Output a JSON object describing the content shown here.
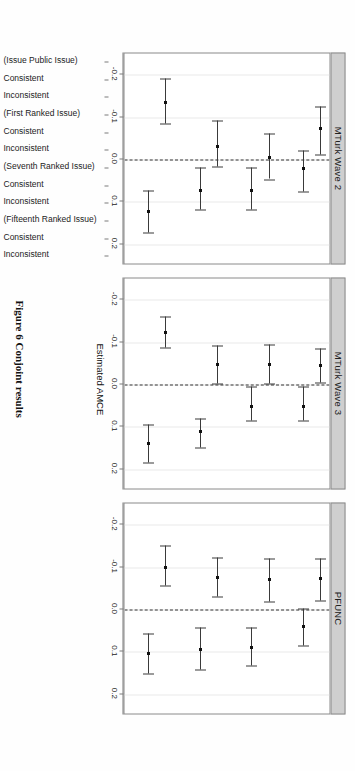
{
  "figure": {
    "caption": "Figure 6 Conjoint results",
    "xtitle": "Estimated AMCE"
  },
  "chart_data": {
    "type": "scatter",
    "title": "Figure 6 Conjoint results",
    "xlabel": "Estimated AMCE",
    "ylabel": "",
    "xlim": [
      -0.25,
      0.25
    ],
    "xticks": [
      -0.2,
      -0.1,
      0.0,
      0.1,
      0.2
    ],
    "xticklabels": [
      "-0.2",
      "-0.1",
      "0.0",
      "0.1",
      "0.2"
    ],
    "grid": true,
    "legend": "none",
    "reference_line": 0.0,
    "orientation": "horizontal-forest-plot",
    "categories": [
      "(Issue Public Issue)",
      "Consistent",
      "Inconsistent",
      "(First Ranked Issue)",
      "Consistent",
      "Inconsistent",
      "(Seventh Ranked Issue)",
      "Consistent",
      "Inconsistent",
      "(Fifteenth Ranked Issue)",
      "Consistent",
      "Inconsistent"
    ],
    "panels": [
      {
        "name": "MTurk Wave 2",
        "points": [
          {
            "category": "(Issue Public Issue)",
            "estimate": null,
            "lower": null,
            "upper": null
          },
          {
            "category": "Consistent",
            "estimate": 0.122,
            "lower": 0.073,
            "upper": 0.173
          },
          {
            "category": "Inconsistent",
            "estimate": -0.135,
            "lower": -0.19,
            "upper": -0.086
          },
          {
            "category": "(First Ranked Issue)",
            "estimate": null,
            "lower": null,
            "upper": null
          },
          {
            "category": "Consistent",
            "estimate": 0.072,
            "lower": 0.02,
            "upper": 0.118
          },
          {
            "category": "Inconsistent",
            "estimate": -0.03,
            "lower": -0.092,
            "upper": 0.017
          },
          {
            "category": "(Seventh Ranked Issue)",
            "estimate": null,
            "lower": null,
            "upper": null
          },
          {
            "category": "Consistent",
            "estimate": 0.072,
            "lower": 0.018,
            "upper": 0.118
          },
          {
            "category": "Inconsistent",
            "estimate": -0.005,
            "lower": -0.062,
            "upper": 0.046
          },
          {
            "category": "(Fifteenth Ranked Issue)",
            "estimate": null,
            "lower": null,
            "upper": null
          },
          {
            "category": "Consistent",
            "estimate": 0.022,
            "lower": -0.022,
            "upper": 0.075
          },
          {
            "category": "Inconsistent",
            "estimate": -0.072,
            "lower": -0.124,
            "upper": -0.012
          }
        ]
      },
      {
        "name": "MTurk Wave 3",
        "points": [
          {
            "category": "(Issue Public Issue)",
            "estimate": null,
            "lower": null,
            "upper": null
          },
          {
            "category": "Consistent",
            "estimate": 0.14,
            "lower": 0.094,
            "upper": 0.185
          },
          {
            "category": "Inconsistent",
            "estimate": -0.122,
            "lower": -0.16,
            "upper": -0.088
          },
          {
            "category": "(First Ranked Issue)",
            "estimate": null,
            "lower": null,
            "upper": null
          },
          {
            "category": "Consistent",
            "estimate": 0.112,
            "lower": 0.08,
            "upper": 0.148
          },
          {
            "category": "Inconsistent",
            "estimate": -0.048,
            "lower": -0.092,
            "upper": -0.002
          },
          {
            "category": "(Seventh Ranked Issue)",
            "estimate": null,
            "lower": null,
            "upper": null
          },
          {
            "category": "Consistent",
            "estimate": 0.052,
            "lower": 0.004,
            "upper": 0.086
          },
          {
            "category": "Inconsistent",
            "estimate": -0.048,
            "lower": -0.094,
            "upper": -0.002
          },
          {
            "category": "(Fifteenth Ranked Issue)",
            "estimate": null,
            "lower": null,
            "upper": null
          },
          {
            "category": "Consistent",
            "estimate": 0.052,
            "lower": 0.004,
            "upper": 0.086
          },
          {
            "category": "Inconsistent",
            "estimate": -0.044,
            "lower": -0.084,
            "upper": -0.004
          }
        ]
      },
      {
        "name": "PFUNC",
        "points": [
          {
            "category": "(Issue Public Issue)",
            "estimate": null,
            "lower": null,
            "upper": null
          },
          {
            "category": "Consistent",
            "estimate": 0.104,
            "lower": 0.056,
            "upper": 0.15
          },
          {
            "category": "Inconsistent",
            "estimate": -0.098,
            "lower": -0.15,
            "upper": -0.056
          },
          {
            "category": "(First Ranked Issue)",
            "estimate": null,
            "lower": null,
            "upper": null
          },
          {
            "category": "Consistent",
            "estimate": 0.094,
            "lower": 0.042,
            "upper": 0.142
          },
          {
            "category": "Inconsistent",
            "estimate": -0.076,
            "lower": -0.122,
            "upper": -0.03
          },
          {
            "category": "(Seventh Ranked Issue)",
            "estimate": null,
            "lower": null,
            "upper": null
          },
          {
            "category": "Consistent",
            "estimate": 0.09,
            "lower": 0.042,
            "upper": 0.132
          },
          {
            "category": "Inconsistent",
            "estimate": -0.07,
            "lower": -0.12,
            "upper": -0.018
          },
          {
            "category": "(Fifteenth Ranked Issue)",
            "estimate": null,
            "lower": null,
            "upper": null
          },
          {
            "category": "Consistent",
            "estimate": 0.04,
            "lower": -0.002,
            "upper": 0.084
          },
          {
            "category": "Inconsistent",
            "estimate": -0.072,
            "lower": -0.12,
            "upper": -0.022
          }
        ]
      }
    ]
  },
  "colors": {
    "strip_fill": "#cfcfcf",
    "strip_border": "#8a8a8a",
    "point": "#111111",
    "errorbar": "#3a3a3a",
    "grid": "#e9e9e9",
    "zero_line": "#333333"
  }
}
